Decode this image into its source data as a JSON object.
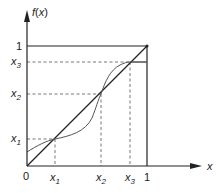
{
  "diagram": {
    "y_axis_label": "f(x)",
    "x_axis_label": "x",
    "origin_label": "0",
    "x_ticks": [
      {
        "base": "x",
        "sub": "1"
      },
      {
        "base": "x",
        "sub": "2"
      },
      {
        "base": "x",
        "sub": "3"
      },
      {
        "base": "1",
        "sub": ""
      }
    ],
    "y_ticks": [
      {
        "base": "x",
        "sub": "1"
      },
      {
        "base": "x",
        "sub": "2"
      },
      {
        "base": "x",
        "sub": "3"
      },
      {
        "base": "1",
        "sub": ""
      }
    ],
    "elements": {
      "identity_line": "y = x diagonal",
      "curve": "f(x) fixed-point curve intersecting diagonal at x1, x2, x3",
      "unit_square": "box from (0,0) to (1,1)",
      "guides": "dashed projections from fixed points to axes"
    },
    "colors": {
      "line": "#222222",
      "curve": "#555555",
      "dashed": "#666666"
    }
  }
}
